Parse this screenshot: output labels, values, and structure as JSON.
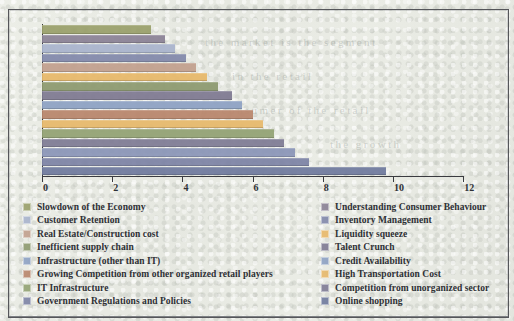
{
  "chart_data": {
    "type": "bar",
    "orientation": "horizontal",
    "title": "",
    "xlabel": "",
    "ylabel": "",
    "xlim": [
      0,
      12
    ],
    "xticks": [
      "0",
      "2",
      "4",
      "6",
      "8",
      "10",
      "12"
    ],
    "grid": false,
    "legend_position": "bottom",
    "categories": [
      "Slowdown of the Economy",
      "Understanding Consumer Behaviour",
      "Customer Retention",
      "Inventory Management",
      "Real Estate/Construction cost",
      "Liquidity squeeze",
      "Inefficient supply chain",
      "Talent Crunch",
      "Infrastructure (other than IT)",
      "Credit Availability",
      "Growing Competition from other organized retail players",
      "High Transportation Cost",
      "IT Infrastructure",
      "Competition from unorganized sector",
      "Government Regulations and Policies",
      "Online shopping"
    ],
    "values": [
      3.1,
      3.5,
      3.8,
      4.1,
      4.4,
      4.7,
      5.0,
      5.4,
      5.7,
      6.0,
      6.3,
      6.6,
      6.9,
      7.2,
      7.6,
      9.8
    ],
    "colors": [
      "#9aa06b",
      "#8b8296",
      "#a9b4cd",
      "#8289ab",
      "#c2a08e",
      "#e8b96a",
      "#8d9a6f",
      "#7f7a92",
      "#8ea2c4",
      "#b9866c",
      "#e7b96b",
      "#93a274",
      "#7f7c95",
      "#8b96b8",
      "#7e84a6",
      "#6f7a9e"
    ]
  },
  "legend": {
    "left_column": [
      {
        "label": "Slowdown of the Economy",
        "color": "#9aa06b"
      },
      {
        "label": "Customer Retention",
        "color": "#a9b4cd"
      },
      {
        "label": "Real Estate/Construction cost",
        "color": "#c2a08e"
      },
      {
        "label": "Inefficient supply chain",
        "color": "#8d9a6f"
      },
      {
        "label": "Infrastructure (other than IT)",
        "color": "#8ea2c4"
      },
      {
        "label": "Growing Competition from other organized retail players",
        "color": "#b9866c"
      },
      {
        "label": "IT Infrastructure",
        "color": "#93a274"
      },
      {
        "label": "Government Regulations and Policies",
        "color": "#7e84a6"
      }
    ],
    "right_column": [
      {
        "label": "Understanding Consumer Behaviour",
        "color": "#8b8296"
      },
      {
        "label": "Inventory Management",
        "color": "#8289ab"
      },
      {
        "label": "Liquidity squeeze",
        "color": "#e8b96a"
      },
      {
        "label": "Talent Crunch",
        "color": "#7f7a92"
      },
      {
        "label": "Credit Availability",
        "color": "#8ea2c4"
      },
      {
        "label": "High Transportation Cost",
        "color": "#e7b96b"
      },
      {
        "label": "Competition from unorganized sector",
        "color": "#7f7c95"
      },
      {
        "label": "Online shopping",
        "color": "#6f7a9e"
      }
    ]
  },
  "background_ghost_text": [
    {
      "text": "the market is the segment",
      "x": 205,
      "y": 36
    },
    {
      "text": "in the retail",
      "x": 232,
      "y": 70
    },
    {
      "text": "the consumer of the retail",
      "x": 196,
      "y": 104
    },
    {
      "text": "the growth",
      "x": 330,
      "y": 138
    }
  ]
}
